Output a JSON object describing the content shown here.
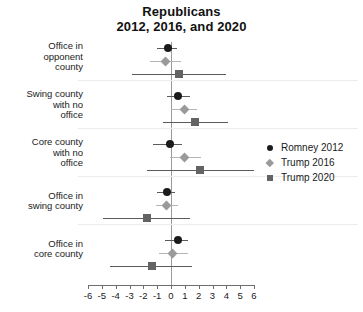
{
  "chart_data": {
    "type": "scatter",
    "title": "Republicans",
    "subtitle": "2012, 2016, and 2020",
    "title_lines": [
      "Republicans",
      "2012, 2016, and 2020"
    ],
    "xlabel": "",
    "ylabel": "",
    "xlim": [
      -6,
      6
    ],
    "xticks": [
      -6,
      -5,
      -4,
      -3,
      -2,
      -1,
      0,
      1,
      2,
      3,
      4,
      5,
      6
    ],
    "xtick_labels": [
      "-6",
      "-5",
      "-4",
      "-3",
      "-2",
      "-1",
      "0",
      "1",
      "2",
      "3",
      "4",
      "5",
      "6"
    ],
    "grid": "horizontal-faint",
    "reference_line": 0,
    "legend_position": "right",
    "categories": [
      "Office in opponent county",
      "Swing county with no office",
      "Core county with no office",
      "Office in swing county",
      "Office in core county"
    ],
    "category_label_lines": [
      [
        "Office in",
        "opponent",
        "county"
      ],
      [
        "Swing county",
        "with no",
        "office"
      ],
      [
        "Core county",
        "with no",
        "office"
      ],
      [
        "Office in",
        "swing county"
      ],
      [
        "Office in",
        "core county"
      ]
    ],
    "series": [
      {
        "name": "Romney 2012",
        "marker": "circle",
        "color": "#1b1b1b",
        "estimates": [
          -0.2,
          0.5,
          -0.1,
          -0.3,
          0.5
        ],
        "ci_low": [
          -1.0,
          -0.3,
          -1.3,
          -1.0,
          -0.4
        ],
        "ci_high": [
          0.4,
          1.4,
          0.8,
          0.3,
          1.2
        ]
      },
      {
        "name": "Trump 2016",
        "marker": "diamond",
        "color": "#9a9a9a",
        "estimates": [
          -0.4,
          1.0,
          1.0,
          -0.3,
          0.1
        ],
        "ci_low": [
          -1.5,
          0.0,
          -0.1,
          -1.1,
          -0.9
        ],
        "ci_high": [
          0.7,
          1.9,
          2.2,
          0.5,
          1.2
        ]
      },
      {
        "name": "Trump 2020",
        "marker": "square",
        "color": "#636363",
        "estimates": [
          0.6,
          1.7,
          2.1,
          -1.7,
          -1.4
        ],
        "ci_low": [
          -2.8,
          -0.6,
          -1.7,
          -4.9,
          -4.4
        ],
        "ci_high": [
          4.0,
          4.1,
          6.0,
          1.4,
          1.5
        ]
      }
    ]
  },
  "legend": {
    "items": [
      {
        "label": "Romney 2012",
        "marker": "circle"
      },
      {
        "label": "Trump 2016",
        "marker": "diamond"
      },
      {
        "label": "Trump 2020",
        "marker": "square"
      }
    ]
  }
}
